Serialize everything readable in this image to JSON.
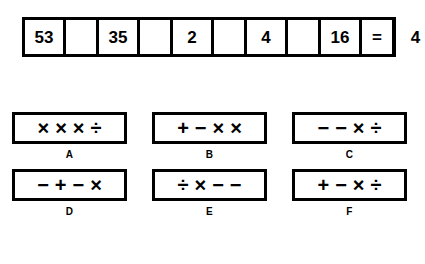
{
  "puzzle": {
    "equation": {
      "cells": [
        {
          "text": "53",
          "type": "number"
        },
        {
          "text": "",
          "type": "blank"
        },
        {
          "text": "35",
          "type": "number"
        },
        {
          "text": "",
          "type": "blank"
        },
        {
          "text": "2",
          "type": "number"
        },
        {
          "text": "",
          "type": "blank"
        },
        {
          "text": "4",
          "type": "number"
        },
        {
          "text": "",
          "type": "blank"
        },
        {
          "text": "16",
          "type": "number"
        },
        {
          "text": "=",
          "type": "equals"
        },
        {
          "text": "4",
          "type": "number"
        }
      ]
    },
    "options": [
      {
        "label": "A",
        "operators": [
          "×",
          "×",
          "×",
          "÷"
        ]
      },
      {
        "label": "B",
        "operators": [
          "+",
          "−",
          "×",
          "×"
        ]
      },
      {
        "label": "C",
        "operators": [
          "−",
          "−",
          "×",
          "÷"
        ]
      },
      {
        "label": "D",
        "operators": [
          "−",
          "+",
          "−",
          "×"
        ]
      },
      {
        "label": "E",
        "operators": [
          "÷",
          "×",
          "−",
          "−"
        ]
      },
      {
        "label": "F",
        "operators": [
          "+",
          "−",
          "×",
          "÷"
        ]
      }
    ],
    "colors": {
      "ink": "#000000",
      "background": "#ffffff"
    }
  }
}
